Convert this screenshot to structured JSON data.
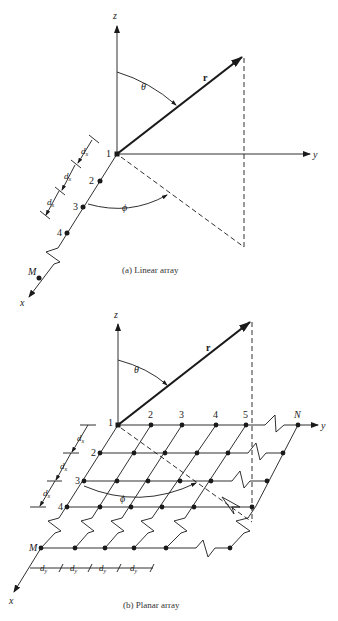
{
  "figure_a": {
    "caption": "(a)  Linear array",
    "axes": {
      "x": "x",
      "y": "y",
      "z": "z"
    },
    "vector_label": "r",
    "angles": {
      "theta": "θ",
      "phi": "ϕ"
    },
    "element_labels": [
      "1",
      "2",
      "3",
      "4",
      "M"
    ],
    "spacing_label": "d",
    "spacing_sub": "x"
  },
  "figure_b": {
    "caption": "(b)  Planar array",
    "axes": {
      "x": "x",
      "y": "y",
      "z": "z"
    },
    "vector_label": "r",
    "angles": {
      "theta": "θ",
      "phi": "ϕ"
    },
    "row_labels": [
      "1",
      "2",
      "3",
      "4",
      "M"
    ],
    "column_labels": [
      "2",
      "3",
      "4",
      "5",
      "N"
    ],
    "spacing_x_label": "d",
    "spacing_x_sub": "x",
    "spacing_y_label": "d",
    "spacing_y_sub": "y"
  },
  "colors": {
    "ink": "#1a1a1a",
    "background": "#ffffff"
  }
}
